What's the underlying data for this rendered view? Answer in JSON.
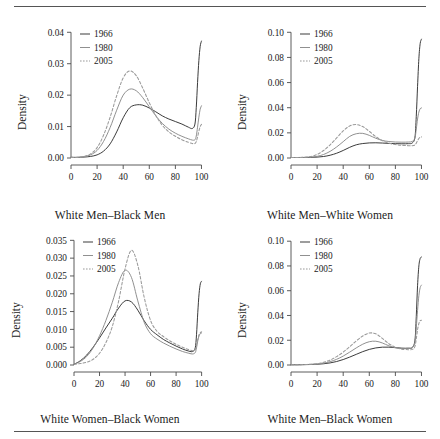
{
  "figure": {
    "ylabel": "Density",
    "legend_entries": [
      {
        "label": "1966",
        "style": "solid",
        "color": "#303030"
      },
      {
        "label": "1980",
        "style": "solid",
        "color": "#8a8a8a"
      },
      {
        "label": "2005",
        "style": "dotted",
        "color": "#9a9a9a"
      }
    ]
  },
  "chart_data": [
    {
      "type": "line",
      "title": "",
      "xlabel": "White Men–Black Men",
      "ylabel": "Density",
      "xlim": [
        0,
        105
      ],
      "ylim": [
        0,
        0.042
      ],
      "xticks": [
        0,
        20,
        40,
        60,
        80,
        100
      ],
      "yticks": [
        0.0,
        0.01,
        0.02,
        0.03,
        0.04
      ],
      "ytick_labels": [
        "0.00",
        "0.01",
        "0.02",
        "0.03",
        "0.04"
      ],
      "grid": false,
      "legend_position": "top-left",
      "x": [
        0,
        5,
        10,
        15,
        20,
        25,
        30,
        35,
        40,
        45,
        50,
        55,
        60,
        65,
        70,
        75,
        80,
        85,
        90,
        93,
        95,
        96,
        97,
        98,
        99,
        100
      ],
      "series": [
        {
          "name": "1966",
          "style": "solid",
          "color": "#303030",
          "values": [
            0.0002,
            0.0002,
            0.0003,
            0.0005,
            0.001,
            0.0022,
            0.0045,
            0.0083,
            0.0128,
            0.016,
            0.0169,
            0.0168,
            0.0159,
            0.0147,
            0.0134,
            0.0124,
            0.0116,
            0.0108,
            0.0098,
            0.0094,
            0.0108,
            0.016,
            0.024,
            0.031,
            0.0355,
            0.0372
          ]
        },
        {
          "name": "1980",
          "style": "solid",
          "color": "#8a8a8a",
          "values": [
            0.0002,
            0.0002,
            0.0004,
            0.001,
            0.0024,
            0.0053,
            0.0097,
            0.0152,
            0.02,
            0.0219,
            0.0214,
            0.0192,
            0.0163,
            0.0134,
            0.011,
            0.0092,
            0.0079,
            0.0069,
            0.0061,
            0.0057,
            0.0058,
            0.007,
            0.0098,
            0.013,
            0.0155,
            0.0166
          ]
        },
        {
          "name": "2005",
          "style": "dotted",
          "color": "#9a9a9a",
          "values": [
            0.0002,
            0.0002,
            0.0005,
            0.0013,
            0.0033,
            0.0073,
            0.013,
            0.0198,
            0.0255,
            0.0277,
            0.0262,
            0.0222,
            0.0176,
            0.0135,
            0.0104,
            0.0083,
            0.0069,
            0.0058,
            0.005,
            0.0046,
            0.0046,
            0.0052,
            0.0067,
            0.0085,
            0.01,
            0.0107
          ]
        }
      ]
    },
    {
      "type": "line",
      "title": "",
      "xlabel": "White Men–White Women",
      "ylabel": "Density",
      "xlim": [
        0,
        105
      ],
      "ylim": [
        0,
        0.105
      ],
      "xticks": [
        0,
        20,
        40,
        60,
        80,
        100
      ],
      "yticks": [
        0.0,
        0.02,
        0.04,
        0.06,
        0.08,
        0.1
      ],
      "ytick_labels": [
        "0.00",
        "0.02",
        "0.04",
        "0.06",
        "0.08",
        "0.10"
      ],
      "grid": false,
      "legend_position": "top-left",
      "x": [
        0,
        5,
        10,
        15,
        20,
        25,
        30,
        35,
        40,
        45,
        50,
        55,
        60,
        65,
        70,
        75,
        80,
        85,
        90,
        93,
        95,
        96,
        97,
        98,
        99,
        100
      ],
      "series": [
        {
          "name": "1966",
          "style": "solid",
          "color": "#303030",
          "values": [
            0.0004,
            0.0004,
            0.0004,
            0.0005,
            0.0007,
            0.0012,
            0.0022,
            0.0038,
            0.006,
            0.0085,
            0.0105,
            0.0115,
            0.012,
            0.0121,
            0.0119,
            0.0116,
            0.0114,
            0.0113,
            0.0114,
            0.012,
            0.0165,
            0.033,
            0.057,
            0.079,
            0.091,
            0.0945
          ]
        },
        {
          "name": "1980",
          "style": "solid",
          "color": "#8a8a8a",
          "values": [
            0.0004,
            0.0004,
            0.0005,
            0.0007,
            0.0013,
            0.0028,
            0.0053,
            0.0088,
            0.013,
            0.0172,
            0.0193,
            0.0196,
            0.018,
            0.0157,
            0.014,
            0.0131,
            0.0127,
            0.0126,
            0.0127,
            0.0132,
            0.016,
            0.023,
            0.031,
            0.0365,
            0.0392,
            0.0398
          ]
        },
        {
          "name": "2005",
          "style": "dotted",
          "color": "#9a9a9a",
          "values": [
            0.0004,
            0.0004,
            0.0006,
            0.0012,
            0.0028,
            0.006,
            0.0105,
            0.016,
            0.0215,
            0.0255,
            0.0266,
            0.025,
            0.0212,
            0.017,
            0.0138,
            0.0118,
            0.0107,
            0.0101,
            0.0098,
            0.0098,
            0.0104,
            0.0118,
            0.0138,
            0.0155,
            0.0165,
            0.0168
          ]
        }
      ]
    },
    {
      "type": "line",
      "title": "",
      "xlabel": "White Women–Black Women",
      "ylabel": "Density",
      "xlim": [
        0,
        105
      ],
      "ylim": [
        0,
        0.0365
      ],
      "xticks": [
        0,
        20,
        40,
        60,
        80,
        100
      ],
      "yticks": [
        0.0,
        0.005,
        0.01,
        0.015,
        0.02,
        0.025,
        0.03,
        0.035
      ],
      "ytick_labels": [
        "0.000",
        "0.005",
        "0.010",
        "0.015",
        "0.020",
        "0.025",
        "0.030",
        "0.035"
      ],
      "grid": false,
      "legend_position": "top-left",
      "x": [
        0,
        5,
        10,
        15,
        20,
        25,
        30,
        35,
        40,
        45,
        50,
        55,
        60,
        65,
        70,
        75,
        80,
        85,
        90,
        93,
        95,
        96,
        97,
        98,
        99,
        100
      ],
      "series": [
        {
          "name": "1966",
          "style": "solid",
          "color": "#303030",
          "values": [
            0.0002,
            0.0012,
            0.0028,
            0.005,
            0.0076,
            0.0104,
            0.0131,
            0.016,
            0.018,
            0.0177,
            0.0154,
            0.0124,
            0.01,
            0.0085,
            0.0072,
            0.0062,
            0.0053,
            0.0045,
            0.0039,
            0.0038,
            0.0048,
            0.0085,
            0.0148,
            0.02,
            0.0228,
            0.0235
          ]
        },
        {
          "name": "1980",
          "style": "solid",
          "color": "#8a8a8a",
          "values": [
            0.0002,
            0.001,
            0.0024,
            0.0048,
            0.0082,
            0.0125,
            0.0176,
            0.0232,
            0.0266,
            0.0246,
            0.018,
            0.012,
            0.0088,
            0.0073,
            0.0062,
            0.0053,
            0.0045,
            0.0038,
            0.0033,
            0.0031,
            0.0035,
            0.0048,
            0.0068,
            0.0082,
            0.0088,
            0.009
          ]
        },
        {
          "name": "2005",
          "style": "dotted",
          "color": "#9a9a9a",
          "values": [
            0.0002,
            0.0004,
            0.0008,
            0.0016,
            0.0033,
            0.0063,
            0.0108,
            0.018,
            0.027,
            0.0322,
            0.028,
            0.019,
            0.0125,
            0.0095,
            0.008,
            0.0068,
            0.0058,
            0.005,
            0.0043,
            0.004,
            0.0043,
            0.0055,
            0.0072,
            0.0085,
            0.0091,
            0.0093
          ]
        }
      ]
    },
    {
      "type": "line",
      "title": "",
      "xlabel": "White Men–Black Women",
      "ylabel": "Density",
      "xlim": [
        0,
        105
      ],
      "ylim": [
        0,
        0.105
      ],
      "xticks": [
        0,
        20,
        40,
        60,
        80,
        100
      ],
      "yticks": [
        0.0,
        0.02,
        0.04,
        0.06,
        0.08,
        0.1
      ],
      "ytick_labels": [
        "0.00",
        "0.02",
        "0.04",
        "0.06",
        "0.08",
        "0.10"
      ],
      "grid": false,
      "legend_position": "top-left",
      "x": [
        0,
        5,
        10,
        15,
        20,
        25,
        30,
        35,
        40,
        45,
        50,
        55,
        60,
        65,
        70,
        75,
        80,
        85,
        90,
        93,
        95,
        96,
        97,
        98,
        99,
        100
      ],
      "series": [
        {
          "name": "1966",
          "style": "solid",
          "color": "#303030",
          "values": [
            0.0002,
            0.0002,
            0.0003,
            0.0004,
            0.0006,
            0.001,
            0.0017,
            0.0028,
            0.0044,
            0.0064,
            0.0086,
            0.0108,
            0.0126,
            0.0138,
            0.0144,
            0.0144,
            0.014,
            0.0136,
            0.0136,
            0.0142,
            0.02,
            0.039,
            0.064,
            0.08,
            0.086,
            0.0872
          ]
        },
        {
          "name": "1980",
          "style": "solid",
          "color": "#8a8a8a",
          "values": [
            0.0002,
            0.0002,
            0.0003,
            0.0005,
            0.0008,
            0.0015,
            0.0027,
            0.0046,
            0.0072,
            0.0104,
            0.0138,
            0.0168,
            0.0188,
            0.0192,
            0.0178,
            0.0155,
            0.014,
            0.0134,
            0.0134,
            0.014,
            0.0185,
            0.03,
            0.044,
            0.056,
            0.0625,
            0.0645
          ]
        },
        {
          "name": "2005",
          "style": "dotted",
          "color": "#9a9a9a",
          "values": [
            0.0002,
            0.0002,
            0.0004,
            0.0006,
            0.0011,
            0.0022,
            0.004,
            0.0068,
            0.0104,
            0.0148,
            0.0194,
            0.0234,
            0.0258,
            0.0252,
            0.0215,
            0.0172,
            0.0143,
            0.0128,
            0.0124,
            0.0126,
            0.015,
            0.021,
            0.0285,
            0.0335,
            0.0358,
            0.0362
          ]
        }
      ]
    }
  ]
}
